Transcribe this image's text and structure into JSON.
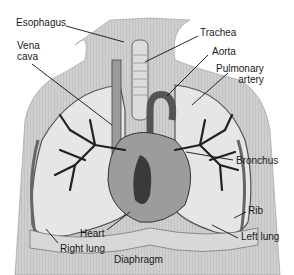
{
  "diagram": {
    "labels": [
      {
        "id": "esophagus",
        "text": "Esophagus"
      },
      {
        "id": "vena-cava",
        "text": "Vena\ncava"
      },
      {
        "id": "trachea",
        "text": "Trachea"
      },
      {
        "id": "aorta",
        "text": "Aorta"
      },
      {
        "id": "pulmonary-artery",
        "text": "Pulmonary\nartery"
      },
      {
        "id": "bronchus",
        "text": "Bronchus"
      },
      {
        "id": "rib",
        "text": "Rib"
      },
      {
        "id": "left-lung",
        "text": "Left lung"
      },
      {
        "id": "heart",
        "text": "Heart"
      },
      {
        "id": "right-lung",
        "text": "Right lung"
      },
      {
        "id": "diaphragm",
        "text": "Diaphragm"
      }
    ],
    "colors": {
      "ink": "#1a1a1a",
      "body": "#c8c8c8",
      "lung": "#e4e4e4",
      "vessel": "#4a4a4a",
      "heart": "#8a8a8a"
    }
  }
}
